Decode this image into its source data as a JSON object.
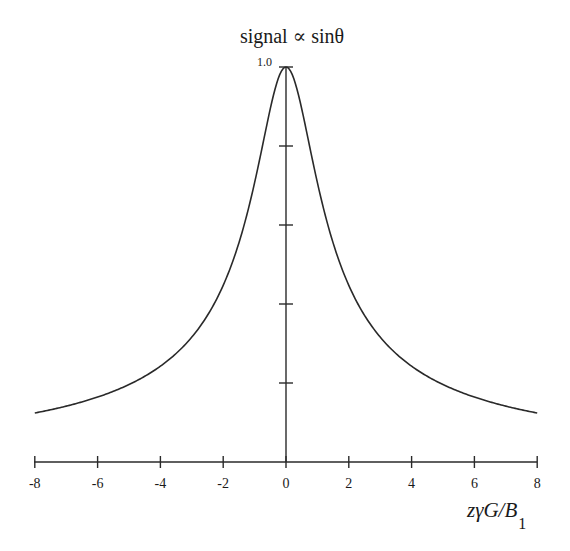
{
  "chart_data": {
    "type": "line",
    "title": "signal ∝ sinθ",
    "xlabel": "zγG/B",
    "xlabel_subscript": "1",
    "ylabel": "",
    "xlim": [
      -8,
      8
    ],
    "ylim": [
      0,
      1.0
    ],
    "x_ticks": [
      -8,
      -6,
      -4,
      -2,
      0,
      2,
      4,
      6,
      8
    ],
    "x_tick_labels": [
      "-8",
      "-6",
      "-4",
      "-2",
      "0",
      "2",
      "4",
      "6",
      "8"
    ],
    "y_ticks": [
      0.2,
      0.4,
      0.6,
      0.8,
      1.0
    ],
    "y_tick_labels": [
      "",
      "",
      "",
      "",
      "1.0"
    ],
    "grid": false,
    "legend": null,
    "function": "1/sqrt(1+x^2)",
    "series": [
      {
        "name": "signal",
        "x": [
          -8,
          -7,
          -6,
          -5,
          -4,
          -3,
          -2,
          -1.5,
          -1,
          -0.5,
          0,
          0.5,
          1,
          1.5,
          2,
          3,
          4,
          5,
          6,
          7,
          8
        ],
        "values": [
          0.124,
          0.141,
          0.164,
          0.196,
          0.243,
          0.316,
          0.447,
          0.555,
          0.707,
          0.894,
          1.0,
          0.894,
          0.707,
          0.555,
          0.447,
          0.316,
          0.243,
          0.196,
          0.164,
          0.141,
          0.124
        ]
      }
    ]
  },
  "colors": {
    "line": "#2a2a2a",
    "axis": "#2a2a2a",
    "background": "#ffffff"
  }
}
